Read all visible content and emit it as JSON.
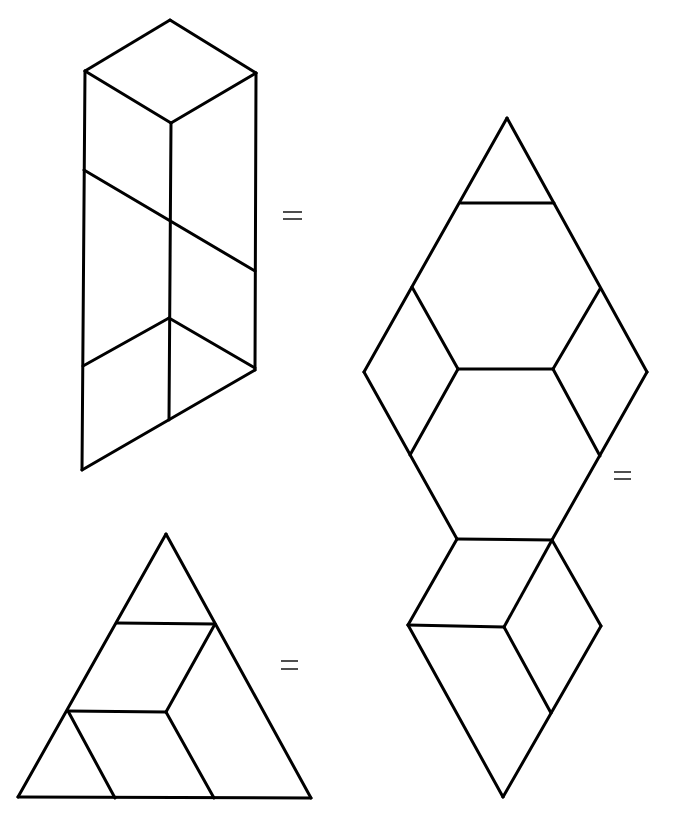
{
  "diagram": {
    "type": "pattern-block-equivalences",
    "colors": {
      "stroke": "#000000",
      "background": "#ffffff",
      "equals": "#222222"
    },
    "figures": [
      {
        "id": "prism-parallelogram",
        "description": "Tall parallelogram with rhombus top, subdivided into rhombi and triangles",
        "segments": [
          [
            [
              170,
              20
            ],
            [
              85,
              71
            ]
          ],
          [
            [
              170,
              20
            ],
            [
              256,
              73
            ]
          ],
          [
            [
              85,
              71
            ],
            [
              171,
              123
            ]
          ],
          [
            [
              256,
              73
            ],
            [
              171,
              123
            ]
          ],
          [
            [
              85,
              71
            ],
            [
              82,
              470
            ]
          ],
          [
            [
              256,
              73
            ],
            [
              255,
              370
            ]
          ],
          [
            [
              171,
              123
            ],
            [
              169,
              420
            ]
          ],
          [
            [
              84,
              170
            ],
            [
              255,
              271
            ]
          ],
          [
            [
              83,
              366
            ],
            [
              169,
              318
            ]
          ],
          [
            [
              169,
              318
            ],
            [
              255,
              368
            ]
          ],
          [
            [
              82,
              470
            ],
            [
              255,
              370
            ]
          ]
        ],
        "equals_sign": {
          "x1": 283,
          "x2": 302,
          "y_top": 212,
          "y_bottom": 219
        }
      },
      {
        "id": "hexagon-rhombus-stack",
        "description": "Large rhombus with hexagon center plus rhombus tail below",
        "segments": [
          [
            [
              507,
              118
            ],
            [
              364,
              372
            ]
          ],
          [
            [
              507,
              118
            ],
            [
              647,
              372
            ]
          ],
          [
            [
              461,
              203
            ],
            [
              554,
              203
            ]
          ],
          [
            [
              412,
              287
            ],
            [
              458,
              369
            ]
          ],
          [
            [
              600,
              289
            ],
            [
              553,
              369
            ]
          ],
          [
            [
              458,
              369
            ],
            [
              553,
              369
            ]
          ],
          [
            [
              364,
              372
            ],
            [
              457,
              539
            ]
          ],
          [
            [
              647,
              372
            ],
            [
              552,
              540
            ]
          ],
          [
            [
              458,
              369
            ],
            [
              410,
              455
            ]
          ],
          [
            [
              553,
              369
            ],
            [
              600,
              456
            ]
          ],
          [
            [
              457,
              539
            ],
            [
              552,
              540
            ]
          ],
          [
            [
              457,
              539
            ],
            [
              408,
              625
            ]
          ],
          [
            [
              552,
              540
            ],
            [
              601,
              626
            ]
          ],
          [
            [
              552,
              540
            ],
            [
              504,
              627
            ]
          ],
          [
            [
              408,
              625
            ],
            [
              504,
              627
            ]
          ],
          [
            [
              504,
              627
            ],
            [
              551,
              713
            ]
          ],
          [
            [
              408,
              625
            ],
            [
              503,
              797
            ]
          ],
          [
            [
              601,
              626
            ],
            [
              503,
              797
            ]
          ]
        ],
        "equals_sign": {
          "x1": 614,
          "x2": 631,
          "y_top": 472,
          "y_bottom": 479
        }
      },
      {
        "id": "triangle-decomposition",
        "description": "Large equilateral triangle split into triangles and rhombi",
        "segments": [
          [
            [
              166,
              534
            ],
            [
              18,
              797
            ]
          ],
          [
            [
              166,
              534
            ],
            [
              311,
              798
            ]
          ],
          [
            [
              18,
              797
            ],
            [
              311,
              798
            ]
          ],
          [
            [
              117,
              623
            ],
            [
              215,
              624
            ]
          ],
          [
            [
              215,
              624
            ],
            [
              166,
              712
            ]
          ],
          [
            [
              68,
              711
            ],
            [
              166,
              712
            ]
          ],
          [
            [
              68,
              711
            ],
            [
              115,
              798
            ]
          ],
          [
            [
              166,
              712
            ],
            [
              214,
              798
            ]
          ]
        ],
        "equals_sign": {
          "x1": 281,
          "x2": 298,
          "y_top": 661,
          "y_bottom": 669
        }
      }
    ],
    "symbols": {
      "equals": "="
    }
  }
}
